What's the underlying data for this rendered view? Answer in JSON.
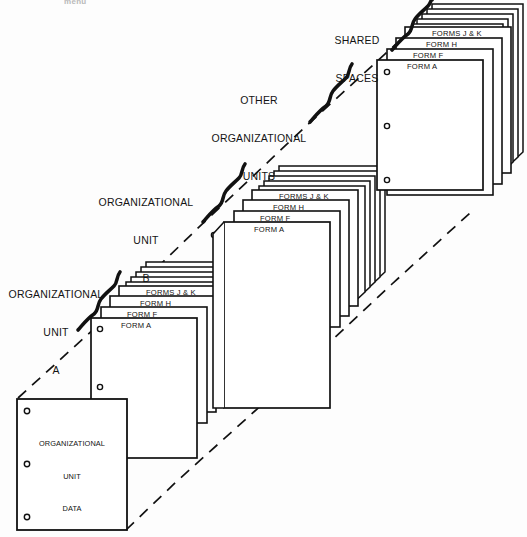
{
  "figure": {
    "type": "perspective-stack-diagram",
    "background": "#fdfdfd",
    "ink": "#111111",
    "cut_header_text": "menu"
  },
  "groups": [
    {
      "id": "organizational-unit-a",
      "label": "ORGANIZATIONAL\nUNIT\nA",
      "label_lines": [
        "ORGANIZATIONAL",
        "UNIT",
        "A"
      ],
      "forms": [
        "FORMS J & K",
        "FORM H",
        "FORM F",
        "FORM A"
      ],
      "extra_sheet_count": 5,
      "front_page_label": "ORGANIZATIONAL\nUNIT\nDATA",
      "front_page_label_lines": [
        "ORGANIZATIONAL",
        "UNIT",
        "DATA"
      ],
      "hole_count": 3
    },
    {
      "id": "organizational-unit-b",
      "label": "ORGANIZATIONAL\nUNIT\nB",
      "label_lines": [
        "ORGANIZATIONAL",
        "UNIT",
        "B"
      ],
      "forms": [
        "FORMS J & K",
        "FORM H",
        "FORM F",
        "FORM A"
      ],
      "extra_sheet_count": 5,
      "hole_count": 1
    },
    {
      "id": "other-organizational-units",
      "label": "OTHER\nORGANIZATIONAL\nUNITS",
      "label_lines": [
        "OTHER",
        "ORGANIZATIONAL",
        "UNITS"
      ],
      "forms": [],
      "extra_sheet_count": 0,
      "hole_count": 0
    },
    {
      "id": "shared-spaces",
      "label": "SHARED\nSPACES",
      "label_lines": [
        "SHARED",
        "SPACES"
      ],
      "forms": [
        "FORMS J & K",
        "FORM H",
        "FORM F",
        "FORM A"
      ],
      "extra_sheet_count": 5,
      "hole_count": 3
    }
  ]
}
